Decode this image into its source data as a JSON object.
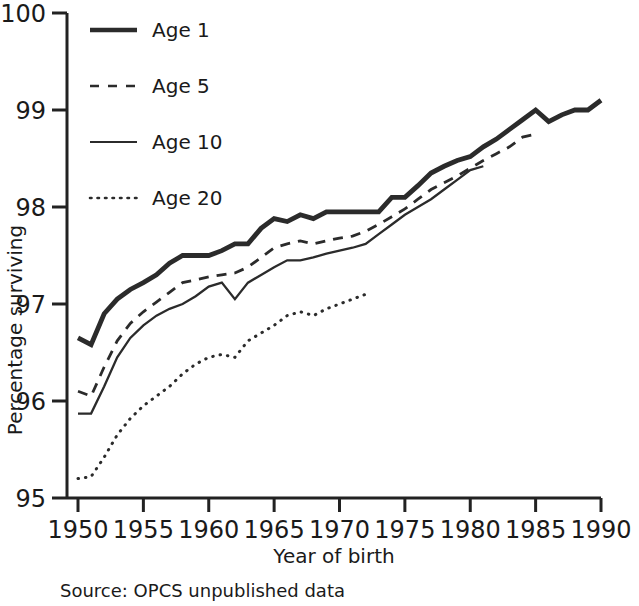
{
  "chart_data": {
    "type": "line",
    "title": "",
    "xlabel": "Year of birth",
    "ylabel": "Percentage surviving",
    "xlim": [
      1950,
      1990
    ],
    "ylim": [
      95,
      100
    ],
    "xticks": [
      1950,
      1955,
      1960,
      1965,
      1970,
      1975,
      1980,
      1985,
      1990
    ],
    "yticks": [
      95,
      96,
      97,
      98,
      99,
      100
    ],
    "grid": false,
    "legend_position": "top-left",
    "source_note": "Source:  OPCS unpublished data",
    "series": [
      {
        "name": "Age 1",
        "style": "solid-thick",
        "color": "#2b2b2b",
        "x": [
          1950,
          1951,
          1952,
          1953,
          1954,
          1955,
          1956,
          1957,
          1958,
          1959,
          1960,
          1961,
          1962,
          1963,
          1964,
          1965,
          1966,
          1967,
          1968,
          1969,
          1970,
          1971,
          1972,
          1973,
          1974,
          1975,
          1976,
          1977,
          1978,
          1979,
          1980,
          1981,
          1982,
          1983,
          1984,
          1985,
          1986,
          1987,
          1988,
          1989,
          1990
        ],
        "y": [
          96.65,
          96.58,
          96.9,
          97.05,
          97.15,
          97.22,
          97.3,
          97.42,
          97.5,
          97.5,
          97.5,
          97.55,
          97.62,
          97.62,
          97.78,
          97.88,
          97.85,
          97.92,
          97.88,
          97.95,
          97.95,
          97.95,
          97.95,
          97.95,
          98.1,
          98.1,
          98.22,
          98.35,
          98.42,
          98.48,
          98.52,
          98.62,
          98.7,
          98.8,
          98.9,
          99.0,
          98.88,
          98.95,
          99.0,
          99.0,
          99.1
        ]
      },
      {
        "name": "Age 5",
        "style": "dashed",
        "color": "#2b2b2b",
        "x": [
          1950,
          1951,
          1952,
          1953,
          1954,
          1955,
          1956,
          1957,
          1958,
          1959,
          1960,
          1961,
          1962,
          1963,
          1964,
          1965,
          1966,
          1967,
          1968,
          1969,
          1970,
          1971,
          1972,
          1973,
          1974,
          1975,
          1976,
          1977,
          1978,
          1979,
          1980,
          1981,
          1982,
          1983,
          1984,
          1985
        ],
        "y": [
          96.1,
          96.05,
          96.35,
          96.62,
          96.8,
          96.92,
          97.02,
          97.12,
          97.22,
          97.25,
          97.28,
          97.3,
          97.32,
          97.38,
          97.48,
          97.58,
          97.62,
          97.65,
          97.62,
          97.65,
          97.68,
          97.7,
          97.75,
          97.82,
          97.9,
          97.98,
          98.08,
          98.18,
          98.25,
          98.32,
          98.4,
          98.48,
          98.55,
          98.62,
          98.72,
          98.75
        ]
      },
      {
        "name": "Age 10",
        "style": "solid-thin",
        "color": "#2b2b2b",
        "x": [
          1950,
          1951,
          1952,
          1953,
          1954,
          1955,
          1956,
          1957,
          1958,
          1959,
          1960,
          1961,
          1962,
          1963,
          1964,
          1965,
          1966,
          1967,
          1968,
          1969,
          1970,
          1971,
          1972,
          1973,
          1974,
          1975,
          1976,
          1977,
          1978,
          1979,
          1980,
          1981
        ],
        "y": [
          95.87,
          95.87,
          96.15,
          96.45,
          96.65,
          96.78,
          96.88,
          96.95,
          97.0,
          97.08,
          97.18,
          97.22,
          97.05,
          97.22,
          97.3,
          97.38,
          97.45,
          97.45,
          97.48,
          97.52,
          97.55,
          97.58,
          97.62,
          97.72,
          97.82,
          97.92,
          98.0,
          98.08,
          98.18,
          98.28,
          98.38,
          98.42
        ]
      },
      {
        "name": "Age 20",
        "style": "dotted",
        "color": "#2b2b2b",
        "x": [
          1950,
          1951,
          1952,
          1953,
          1954,
          1955,
          1956,
          1957,
          1958,
          1959,
          1960,
          1961,
          1962,
          1963,
          1964,
          1965,
          1966,
          1967,
          1968,
          1969,
          1970,
          1971,
          1972
        ],
        "y": [
          95.2,
          95.22,
          95.42,
          95.65,
          95.82,
          95.95,
          96.05,
          96.15,
          96.28,
          96.38,
          96.45,
          96.48,
          96.45,
          96.62,
          96.7,
          96.78,
          96.88,
          96.92,
          96.88,
          96.95,
          97.0,
          97.05,
          97.1
        ]
      }
    ]
  },
  "legend": {
    "items": [
      {
        "label": "Age 1"
      },
      {
        "label": "Age 5"
      },
      {
        "label": "Age 10"
      },
      {
        "label": "Age 20"
      }
    ]
  },
  "axes": {
    "y_title": "Percentage surviving",
    "x_title": "Year of birth",
    "y_tick_labels": [
      "100",
      "99",
      "98",
      "97",
      "96",
      "95"
    ],
    "x_tick_labels": [
      "1950",
      "1955",
      "1960",
      "1965",
      "1970",
      "1975",
      "1980",
      "1985",
      "1990"
    ]
  },
  "footer": {
    "source": "Source:  OPCS unpublished data"
  }
}
